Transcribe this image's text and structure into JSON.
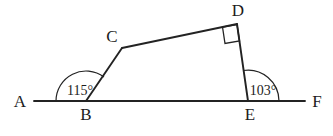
{
  "figure": {
    "type": "geometry-diagram",
    "background_color": "#ffffff",
    "line_color": "#232323",
    "text_color": "#1c1c1c"
  },
  "points": {
    "A": {
      "label": "A",
      "x": 34,
      "y": 101,
      "label_x": 20,
      "label_y": 107
    },
    "B": {
      "label": "B",
      "x": 86,
      "y": 101,
      "label_x": 86,
      "label_y": 120
    },
    "C": {
      "label": "C",
      "x": 122,
      "y": 48,
      "label_x": 112,
      "label_y": 42
    },
    "D": {
      "label": "D",
      "x": 237,
      "y": 24,
      "label_x": 238,
      "label_y": 16
    },
    "E": {
      "label": "E",
      "x": 248,
      "y": 101,
      "label_x": 250,
      "label_y": 120
    },
    "F": {
      "label": "F",
      "x": 305,
      "y": 101,
      "label_x": 317,
      "label_y": 107
    }
  },
  "segments": [
    {
      "name": "baseline-AF",
      "from": "A",
      "to": "F"
    },
    {
      "name": "segment-BC",
      "from": "B",
      "to": "C"
    },
    {
      "name": "segment-CD",
      "from": "C",
      "to": "D"
    },
    {
      "name": "segment-DE",
      "from": "D",
      "to": "E"
    }
  ],
  "angles": [
    {
      "name": "angle-at-B",
      "vertex": "B",
      "value": "115",
      "unit": "°",
      "text": "115°",
      "text_x": 80,
      "text_y": 95,
      "arc_radius": 30,
      "between": [
        "A",
        "C"
      ]
    },
    {
      "name": "angle-at-E",
      "vertex": "E",
      "value": "103",
      "unit": "°",
      "text": "103°",
      "text_x": 263,
      "text_y": 95,
      "arc_radius": 31,
      "between": [
        "F",
        "D"
      ]
    },
    {
      "name": "right-angle-at-D",
      "vertex": "D",
      "value": "90",
      "unit": "°",
      "text": "",
      "marker": "square",
      "between": [
        "C",
        "E"
      ]
    }
  ],
  "labels": {
    "A": "A",
    "B": "B",
    "C": "C",
    "D": "D",
    "E": "E",
    "F": "F",
    "angle_b": "115°",
    "angle_e": "103°"
  }
}
